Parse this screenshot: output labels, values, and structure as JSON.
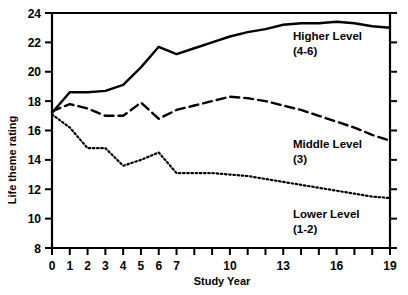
{
  "chart_data": {
    "type": "line",
    "title": "",
    "xlabel": "Study Year",
    "ylabel": "Life theme rating",
    "xlim": [
      0,
      19
    ],
    "ylim": [
      8,
      24
    ],
    "grid": false,
    "legend_position": "inline-right",
    "x": [
      0,
      1,
      2,
      3,
      4,
      5,
      6,
      7,
      8,
      9,
      10,
      11,
      12,
      13,
      14,
      15,
      16,
      17,
      18,
      19
    ],
    "x_tick_values": [
      0,
      1,
      2,
      3,
      4,
      5,
      6,
      7,
      8,
      9,
      10,
      11,
      12,
      13,
      14,
      15,
      16,
      17,
      18,
      19
    ],
    "x_tick_labels": [
      "0",
      "1",
      "2",
      "3",
      "4",
      "5",
      "6",
      "7",
      "",
      "",
      "10",
      "",
      "",
      "13",
      "",
      "",
      "16",
      "",
      "",
      "19"
    ],
    "y_tick_values": [
      8,
      10,
      12,
      14,
      16,
      18,
      20,
      22,
      24
    ],
    "y_tick_labels": [
      "8",
      "10",
      "12",
      "14",
      "16",
      "18",
      "20",
      "22",
      "24"
    ],
    "series": [
      {
        "name": "Higher Level",
        "sublabel": "(4-6)",
        "style": "solid",
        "color": "#000000",
        "label_line1": "Higher Level",
        "label_line2": "(4-6)",
        "values": [
          17.2,
          18.6,
          18.6,
          18.7,
          19.1,
          20.3,
          21.7,
          21.2,
          21.6,
          22.0,
          22.4,
          22.7,
          22.9,
          23.2,
          23.3,
          23.3,
          23.4,
          23.3,
          23.1,
          23.0
        ]
      },
      {
        "name": "Middle Level",
        "sublabel": "(3)",
        "style": "dashed",
        "color": "#000000",
        "label_line1": "Middle Level",
        "label_line2": "(3)",
        "values": [
          17.3,
          17.8,
          17.5,
          17.0,
          17.0,
          17.9,
          16.8,
          17.4,
          17.7,
          18.0,
          18.3,
          18.2,
          18.0,
          17.7,
          17.4,
          17.0,
          16.6,
          16.2,
          15.7,
          15.3
        ]
      },
      {
        "name": "Lower Level",
        "sublabel": "(1-2)",
        "style": "dotted",
        "color": "#000000",
        "label_line1": "Lower Level",
        "label_line2": "(1-2)",
        "values": [
          17.1,
          16.2,
          14.8,
          14.8,
          13.6,
          14.0,
          14.5,
          13.1,
          13.1,
          13.1,
          13.0,
          12.9,
          12.7,
          12.5,
          12.3,
          12.1,
          11.9,
          11.7,
          11.5,
          11.4
        ]
      }
    ]
  },
  "axes": {
    "x_title": "Study Year",
    "y_title": "Life theme rating"
  },
  "annotations": [
    {
      "id": "higher",
      "line1": "Higher Level",
      "line2": "(4-6)",
      "x": 293,
      "y": 40
    },
    {
      "id": "middle",
      "line1": "Middle Level",
      "line2": "(3)",
      "x": 293,
      "y": 148
    },
    {
      "id": "lower",
      "line1": "Lower Level",
      "line2": "(1-2)",
      "x": 293,
      "y": 218
    }
  ],
  "colors": {
    "axis": "#000000",
    "background": "#ffffff",
    "series": "#000000"
  }
}
